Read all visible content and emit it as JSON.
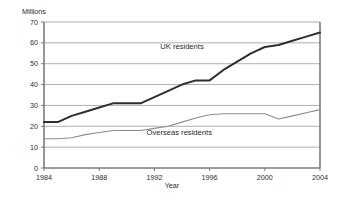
{
  "chart_data": {
    "type": "line",
    "title": "",
    "xlabel": "Year",
    "ylabel": "Millions",
    "xlim": [
      1984,
      2004
    ],
    "ylim": [
      0,
      70
    ],
    "ytick_labels": [
      "0",
      "10",
      "20",
      "30",
      "40",
      "50",
      "60",
      "70"
    ],
    "yticks": [
      0,
      10,
      20,
      30,
      40,
      50,
      60,
      70
    ],
    "xtick_labels": [
      "1984",
      "1988",
      "1992",
      "1996",
      "2000",
      "2004"
    ],
    "xticks": [
      1984,
      1988,
      1992,
      1996,
      2000,
      2004
    ],
    "grid": "horizontal",
    "legend": "inline-annotations",
    "x": [
      1984,
      1985,
      1986,
      1987,
      1988,
      1989,
      1990,
      1991,
      1992,
      1993,
      1994,
      1995,
      1996,
      1997,
      1998,
      1999,
      2000,
      2001,
      2002,
      2003,
      2004
    ],
    "series": [
      {
        "name": "UK residents",
        "color": "#2f2f2f",
        "label_x": 1994,
        "label_y": 57,
        "values": [
          22,
          22,
          25,
          27,
          29,
          31,
          31,
          31,
          34,
          37,
          40,
          42,
          42,
          47,
          51,
          55,
          58,
          59,
          61,
          63,
          65
        ]
      },
      {
        "name": "Overseas residents",
        "color": "#8d8d8d",
        "label_x": 1993.8,
        "label_y": 16,
        "values": [
          14,
          14,
          14.5,
          16,
          17,
          18,
          18,
          18,
          19,
          20,
          22,
          24,
          25.5,
          26,
          26,
          26,
          26,
          23.5,
          25,
          26.5,
          28
        ]
      }
    ]
  },
  "labels": {
    "y_axis_title": "Millions",
    "x_axis_title": "Year",
    "series_uk": "UK residents",
    "series_overseas": "Overseas residents"
  }
}
